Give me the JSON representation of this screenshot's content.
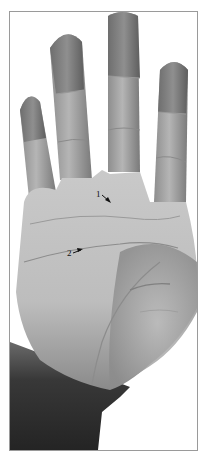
{
  "figure": {
    "colors": {
      "frame": "#9a9a9a",
      "background": "#ffffff",
      "skin_light": "#c8c8c8",
      "skin_mid": "#a8a8a8",
      "skin_dark": "#5a5a5a",
      "wrist": "#2e2e2e",
      "annotation": "#111111"
    },
    "annotations": [
      {
        "label": "1",
        "x": 96,
        "y": 190,
        "arrow_to": [
          106,
          198
        ]
      },
      {
        "label": "2",
        "x": 66,
        "y": 250,
        "arrow_to": [
          80,
          247
        ]
      }
    ]
  }
}
